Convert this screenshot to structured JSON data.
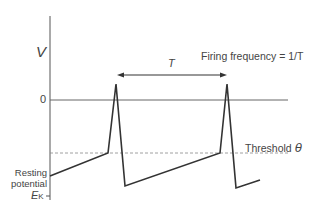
{
  "diagram": {
    "y_axis_label": "V",
    "zero_label": "0",
    "resting_label_line1": "Resting",
    "resting_label_line2": "potential",
    "ek_label_main": "E",
    "ek_label_sub": "K",
    "period_label": "T",
    "frequency_label": "Firing frequency = 1/T",
    "threshold_label": "Threshold",
    "threshold_symbol": "θ",
    "colors": {
      "trace": "#333333",
      "axis": "#555555",
      "threshold_line": "#888888",
      "text": "#444444"
    }
  }
}
